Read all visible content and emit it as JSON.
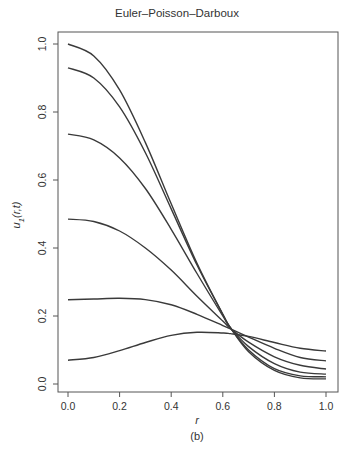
{
  "chart_data": {
    "type": "line",
    "title": "Euler–Poisson–Darboux",
    "caption": "(b)",
    "xlabel": "r",
    "ylabel": "u1(r,t)",
    "ylabel_main": "u",
    "ylabel_sub": "1",
    "ylabel_args": "(r,t)",
    "xlim": [
      0.0,
      1.0
    ],
    "ylim": [
      0.0,
      1.0
    ],
    "x_ticks": [
      "0.0",
      "0.2",
      "0.4",
      "0.6",
      "0.8",
      "1.0"
    ],
    "y_ticks": [
      "0.0",
      "0.2",
      "0.4",
      "0.6",
      "0.8",
      "1.0"
    ],
    "grid": false,
    "legend": null,
    "line_color": "#3a3a3a",
    "x": [
      0.0,
      0.1,
      0.2,
      0.3,
      0.4,
      0.5,
      0.6,
      0.63,
      0.7,
      0.8,
      0.9,
      1.0
    ],
    "series": [
      {
        "name": "curve-1",
        "values": [
          1.0,
          0.965,
          0.865,
          0.71,
          0.53,
          0.355,
          0.205,
          0.165,
          0.095,
          0.04,
          0.018,
          0.015
        ]
      },
      {
        "name": "curve-2",
        "values": [
          0.93,
          0.9,
          0.815,
          0.68,
          0.515,
          0.35,
          0.205,
          0.165,
          0.1,
          0.045,
          0.024,
          0.021
        ]
      },
      {
        "name": "curve-3",
        "values": [
          0.735,
          0.718,
          0.665,
          0.575,
          0.455,
          0.325,
          0.2,
          0.165,
          0.11,
          0.06,
          0.035,
          0.029
        ]
      },
      {
        "name": "curve-4",
        "values": [
          0.485,
          0.478,
          0.45,
          0.4,
          0.335,
          0.258,
          0.185,
          0.163,
          0.123,
          0.08,
          0.055,
          0.044
        ]
      },
      {
        "name": "curve-5",
        "values": [
          0.248,
          0.25,
          0.252,
          0.248,
          0.233,
          0.205,
          0.172,
          0.162,
          0.138,
          0.105,
          0.078,
          0.068
        ]
      },
      {
        "name": "curve-6",
        "values": [
          0.07,
          0.078,
          0.098,
          0.122,
          0.143,
          0.152,
          0.15,
          0.148,
          0.14,
          0.122,
          0.105,
          0.097
        ]
      }
    ]
  }
}
